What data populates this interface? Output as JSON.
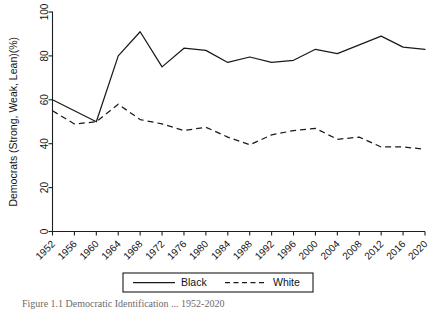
{
  "chart_data": {
    "type": "line",
    "title": "",
    "xlabel": "",
    "ylabel": "Democrats (Strong, Weak, Lean)(%)",
    "ylim": [
      0,
      100
    ],
    "yticks": [
      0,
      20,
      40,
      60,
      80,
      100
    ],
    "grid": false,
    "legend_position": "bottom",
    "categories": [
      "1952",
      "1956",
      "1960",
      "1964",
      "1968",
      "1972",
      "1976",
      "1980",
      "1984",
      "1988",
      "1992",
      "1996",
      "2000",
      "2004",
      "2008",
      "2012",
      "2016",
      "2020"
    ],
    "series": [
      {
        "name": "Black",
        "style": "solid",
        "values": [
          60,
          55,
          50,
          80,
          91,
          75,
          83.5,
          82.5,
          77,
          79.5,
          77,
          78,
          83,
          81,
          85,
          89,
          84,
          83
        ]
      },
      {
        "name": "White",
        "style": "dashed",
        "values": [
          55,
          49,
          50,
          58,
          51,
          49,
          46,
          47.5,
          43,
          39.5,
          44,
          46,
          47,
          42,
          43,
          38.5,
          38.5,
          37.5
        ]
      }
    ]
  },
  "legend": {
    "entries": [
      {
        "label": "Black",
        "style": "solid"
      },
      {
        "label": "White",
        "style": "dashed"
      }
    ]
  },
  "caption": {
    "text": "Figure 1.1   Democratic Identification ... 1952-2020"
  }
}
